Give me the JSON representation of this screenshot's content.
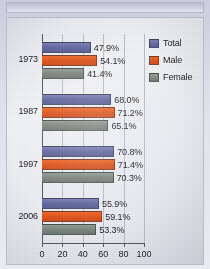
{
  "chart_data": {
    "type": "bar",
    "orientation": "horizontal",
    "title": "",
    "xlabel": "",
    "ylabel": "",
    "categories": [
      "1973",
      "1987",
      "1997",
      "2006"
    ],
    "series": [
      {
        "name": "Total",
        "color": "#656aa2",
        "values": [
          47.9,
          68.0,
          70.8,
          55.9
        ]
      },
      {
        "name": "Male",
        "color": "#e2561e",
        "values": [
          54.1,
          71.2,
          71.4,
          59.1
        ]
      },
      {
        "name": "Female",
        "color": "#7e8a80",
        "values": [
          41.4,
          65.1,
          70.3,
          53.3
        ]
      }
    ],
    "data_labels": [
      [
        "47.9%",
        "54.1%",
        "41.4%"
      ],
      [
        "68.0%",
        "71.2%",
        "65.1%"
      ],
      [
        "70.8%",
        "71.4%",
        "70.3%"
      ],
      [
        "55.9%",
        "59.1%",
        "53.3%"
      ]
    ],
    "xlim": [
      0,
      100
    ],
    "xticks": [
      "0",
      "20",
      "40",
      "60",
      "80",
      "100"
    ],
    "grid": true,
    "legend_position": "top-right"
  },
  "legend": {
    "items": [
      {
        "label": "Total"
      },
      {
        "label": "Male"
      },
      {
        "label": "Female"
      }
    ]
  },
  "axis": {
    "xticks": [
      "0",
      "20",
      "40",
      "60",
      "80",
      "100"
    ],
    "categories": [
      "1973",
      "1987",
      "1997",
      "2006"
    ]
  }
}
